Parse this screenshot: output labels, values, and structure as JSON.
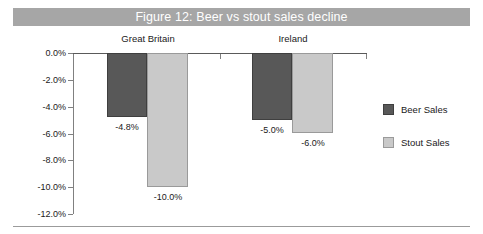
{
  "figure": {
    "title": "Figure 12: Beer vs stout sales decline",
    "title_band_color": "#a6a6a6",
    "title_text_color": "#ffffff",
    "bottom_rule_color": "#9b9b9b"
  },
  "legend": {
    "position": "right",
    "entries": [
      {
        "label": "Beer Sales",
        "color": "#585858"
      },
      {
        "label": "Stout Sales",
        "color": "#c9c9c9"
      }
    ]
  },
  "axis": {
    "ytick_labels": [
      "0.0%",
      "-2.0%",
      "-4.0%",
      "-6.0%",
      "-8.0%",
      "-10.0%",
      "-12.0%"
    ],
    "ytick_values": [
      0,
      -2,
      -4,
      -6,
      -8,
      -10,
      -12
    ]
  },
  "chart_data": {
    "type": "bar",
    "title": "Figure 12: Beer vs stout sales decline",
    "xlabel": "",
    "ylabel": "",
    "categories": [
      "Great Britain",
      "Ireland"
    ],
    "series": [
      {
        "name": "Beer Sales",
        "color": "#585858",
        "values": [
          -4.8,
          -5.0
        ],
        "labels": [
          "-4.8%",
          "-5.0%"
        ]
      },
      {
        "name": "Stout Sales",
        "color": "#c9c9c9",
        "values": [
          -10.0,
          -6.0
        ],
        "labels": [
          "-10.0%",
          "-6.0%"
        ]
      }
    ],
    "ylim": [
      -12,
      0
    ],
    "ytick_labels": [
      "0.0%",
      "-2.0%",
      "-4.0%",
      "-6.0%",
      "-8.0%",
      "-10.0%",
      "-12.0%"
    ],
    "grid": false,
    "legend_position": "right",
    "units": "percent"
  }
}
